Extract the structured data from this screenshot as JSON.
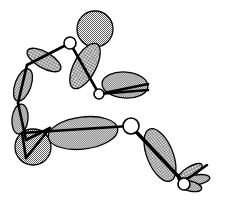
{
  "document": {
    "title": "Articulated Figure Diagram",
    "background_color": "#ffffff",
    "width": 226,
    "height": 200
  },
  "style": {
    "fill_pattern": "checkerboard-dither",
    "fill_tone_hex": "#9a9a9a",
    "outline_color": "#000000",
    "bone_color": "#000000",
    "joint_fill": "#ffffff",
    "joint_stroke": "#000000"
  },
  "figure": {
    "name": "seated-articulated-figure",
    "segments": [
      {
        "id": "head",
        "label": "Head",
        "shape": "circle",
        "cx": 95,
        "cy": 29,
        "r": 18
      },
      {
        "id": "upper-arm-right",
        "label": "Right upper arm",
        "shape": "ellipse",
        "cx": 85,
        "cy": 66,
        "rx": 11,
        "ry": 25,
        "rotation": 28
      },
      {
        "id": "forearm-right",
        "label": "Right forearm",
        "shape": "ellipse",
        "cx": 125,
        "cy": 85,
        "rx": 23,
        "ry": 13,
        "rotation": 4
      },
      {
        "id": "upper-arm-left",
        "label": "Left upper arm",
        "shape": "ellipse",
        "cx": 44,
        "cy": 60,
        "rx": 19,
        "ry": 8,
        "rotation": 30
      },
      {
        "id": "forearm-left",
        "label": "Left forearm",
        "shape": "ellipse",
        "cx": 23,
        "cy": 85,
        "rx": 8,
        "ry": 17,
        "rotation": 20
      },
      {
        "id": "hand-left",
        "label": "Left hand",
        "shape": "ellipse",
        "cx": 20,
        "cy": 119,
        "rx": 8,
        "ry": 15,
        "rotation": 6
      },
      {
        "id": "hip",
        "label": "Hip",
        "shape": "circle",
        "cx": 33,
        "cy": 147,
        "r": 18
      },
      {
        "id": "torso",
        "label": "Torso",
        "shape": "ellipse",
        "cx": 83,
        "cy": 133,
        "rx": 35,
        "ry": 16,
        "rotation": -7
      },
      {
        "id": "thigh-right",
        "label": "Right thigh",
        "shape": "ellipse",
        "cx": 160,
        "cy": 155,
        "rx": 13,
        "ry": 28,
        "rotation": -22
      },
      {
        "id": "foot-blade-1",
        "label": "Foot blade 1",
        "shape": "ellipse",
        "cx": 190,
        "cy": 172,
        "rx": 14,
        "ry": 5,
        "rotation": -32
      },
      {
        "id": "foot-blade-2",
        "label": "Foot blade 2",
        "shape": "ellipse",
        "cx": 196,
        "cy": 180,
        "rx": 14,
        "ry": 5,
        "rotation": -10
      },
      {
        "id": "foot-blade-3",
        "label": "Foot blade 3",
        "shape": "ellipse",
        "cx": 190,
        "cy": 186,
        "rx": 12,
        "ry": 5,
        "rotation": 14
      }
    ],
    "bones": [
      {
        "id": "bone-shoulder-to-elbow-right",
        "from": [
          70,
          43
        ],
        "to": [
          99,
          94
        ]
      },
      {
        "id": "bone-elbow-to-wrist-right",
        "from": [
          99,
          94
        ],
        "to": [
          148,
          84
        ]
      },
      {
        "id": "bone-elbow-to-wrist-right-2",
        "from": [
          99,
          94
        ],
        "to": [
          148,
          90
        ]
      },
      {
        "id": "bone-shoulder-to-elbow-left",
        "from": [
          70,
          43
        ],
        "to": [
          27,
          65
        ]
      },
      {
        "id": "bone-elbow-to-wrist-left",
        "from": [
          27,
          65
        ],
        "to": [
          18,
          103
        ]
      },
      {
        "id": "bone-wrist-to-hand-left",
        "from": [
          18,
          103
        ],
        "to": [
          26,
          140
        ]
      },
      {
        "id": "bone-hip-to-shoulder",
        "from": [
          26,
          140
        ],
        "to": [
          50,
          128
        ]
      },
      {
        "id": "bone-torso-spine",
        "from": [
          22,
          133
        ],
        "to": [
          129,
          126
        ]
      },
      {
        "id": "bone-hip-fork",
        "from": [
          26,
          158
        ],
        "to": [
          22,
          133
        ]
      },
      {
        "id": "bone-hip-fork-2",
        "from": [
          26,
          158
        ],
        "to": [
          50,
          128
        ]
      },
      {
        "id": "bone-hip-to-knee-right",
        "from": [
          131,
          127
        ],
        "to": [
          183,
          182
        ]
      },
      {
        "id": "bone-hip-to-knee-right-2",
        "from": [
          135,
          130
        ],
        "to": [
          186,
          184
        ]
      },
      {
        "id": "bone-knee-to-foot",
        "from": [
          183,
          182
        ],
        "to": [
          207,
          165
        ]
      }
    ],
    "joints": [
      {
        "id": "joint-shoulder",
        "label": "Shoulder joint",
        "cx": 70,
        "cy": 43,
        "r": 6
      },
      {
        "id": "joint-elbow-right",
        "label": "Right elbow joint",
        "cx": 99,
        "cy": 94,
        "r": 5
      },
      {
        "id": "joint-hip-right",
        "label": "Right hip joint",
        "cx": 131,
        "cy": 126,
        "r": 8
      },
      {
        "id": "joint-ankle-right",
        "label": "Right ankle joint",
        "cx": 184,
        "cy": 184,
        "r": 6
      }
    ]
  }
}
